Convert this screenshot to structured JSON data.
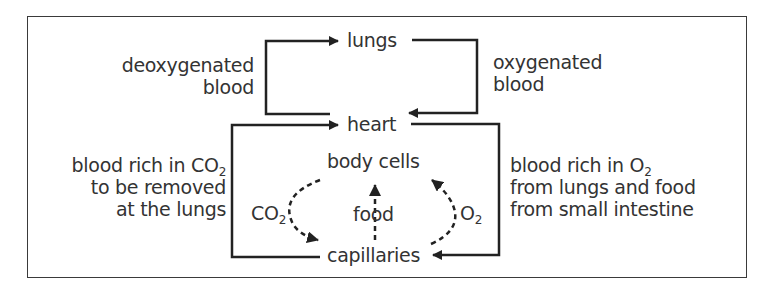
{
  "diagram": {
    "type": "flow",
    "nodes": {
      "lungs": "lungs",
      "heart": "heart",
      "body_cells": "body cells",
      "capillaries": "capillaries"
    },
    "labels": {
      "deoxygenated_line1": "deoxygenated",
      "deoxygenated_line2": "blood",
      "oxygenated_line1": "oxygenated",
      "oxygenated_line2": "blood",
      "co2_rich_line1_pre": "blood rich in CO",
      "co2_rich_line1_sub": "2",
      "co2_rich_line2": "to be removed",
      "co2_rich_line3": "at the lungs",
      "o2_rich_line1_pre": "blood rich in O",
      "o2_rich_line1_sub": "2",
      "o2_rich_line2": "from lungs and food",
      "o2_rich_line3": "from small intestine",
      "co2_pre": "CO",
      "co2_sub": "2",
      "food": "food",
      "o2_pre": "O",
      "o2_sub": "2"
    },
    "edges": [
      {
        "from": "heart",
        "to": "lungs",
        "label": "deoxygenated blood",
        "style": "solid"
      },
      {
        "from": "lungs",
        "to": "heart",
        "label": "oxygenated blood",
        "style": "solid"
      },
      {
        "from": "heart",
        "to": "capillaries",
        "label": "blood rich in O2 from lungs and food from small intestine",
        "style": "solid"
      },
      {
        "from": "capillaries",
        "to": "heart",
        "label": "blood rich in CO2 to be removed at the lungs",
        "style": "solid"
      },
      {
        "from": "capillaries",
        "to": "body cells",
        "label": "food",
        "style": "dotted"
      },
      {
        "from": "capillaries",
        "to": "body cells",
        "label": "O2",
        "style": "dotted"
      },
      {
        "from": "body cells",
        "to": "capillaries",
        "label": "CO2",
        "style": "dotted"
      }
    ],
    "colors": {
      "line": "#222222",
      "text": "#333333",
      "frame": "#3a3a3a"
    }
  }
}
